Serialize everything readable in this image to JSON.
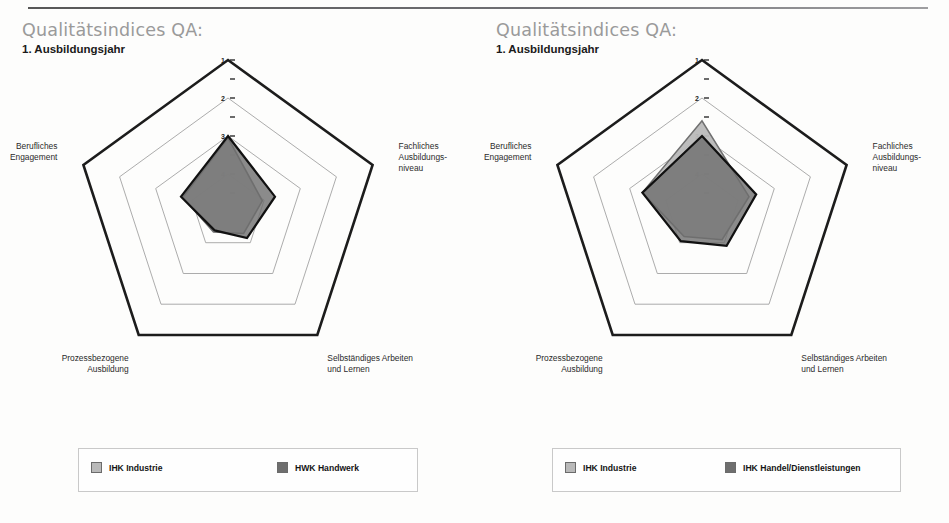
{
  "document": {
    "top_rule": true
  },
  "panels": [
    {
      "id": "left",
      "title": "Qualitätsindices QA:",
      "subtitle": "1. Ausbildungsjahr",
      "legend": [
        {
          "label": "IHK Industrie",
          "color": "#b9b9b9",
          "swatch": "light-gray-swatch"
        },
        {
          "label": "HWK Handwerk",
          "color": "#6e6e6e",
          "swatch": "dark-gray-swatch"
        }
      ]
    },
    {
      "id": "right",
      "title": "Qualitätsindices QA:",
      "subtitle": "1. Ausbildungsjahr",
      "legend": [
        {
          "label": "IHK Industrie",
          "color": "#b9b9b9",
          "swatch": "light-gray-swatch"
        },
        {
          "label": "IHK Handel/Dienstleistungen",
          "color": "#6e6e6e",
          "swatch": "dark-gray-swatch"
        }
      ]
    }
  ],
  "chart_data": [
    {
      "type": "radar",
      "title": "Qualitätsindices QA: 1. Ausbildungsjahr",
      "subtitle": "IHK Industrie vs. HWK Handwerk",
      "categories": [
        "Erfahrungsbasiertes Lernen",
        "Fachliches Ausbildungs-niveau",
        "Selbständiges Arbeiten und Lernen",
        "Prozessbezogene Ausbildung",
        "Berufliches Engagement"
      ],
      "category_lines": [
        [
          "Erfahrungsbasiertes",
          "Lernen"
        ],
        [
          "Fachliches",
          "Ausbildungs-",
          "niveau"
        ],
        [
          "Selbständiges Arbeiten",
          "und Lernen"
        ],
        [
          "Prozessbezogene",
          "Ausbildung"
        ],
        [
          "Berufliches",
          "Engagement"
        ]
      ],
      "rlim": [
        1,
        5
      ],
      "inverted_scale": true,
      "tick_labels": [
        "1",
        "2",
        "3",
        "4"
      ],
      "tick_values": [
        1,
        2,
        3,
        4
      ],
      "minor_tick_values": [
        1.5,
        2.5,
        3.5,
        4.5
      ],
      "grid": true,
      "legend_position": "bottom",
      "series": [
        {
          "name": "IHK Industrie",
          "color": "#b9b9b9",
          "values": [
            3.05,
            4.05,
            4.3,
            4.35,
            3.75
          ]
        },
        {
          "name": "HWK Handwerk",
          "color": "#6e6e6e",
          "values": [
            3.0,
            3.7,
            4.15,
            4.4,
            3.7
          ]
        }
      ]
    },
    {
      "type": "radar",
      "title": "Qualitätsindices QA: 1. Ausbildungsjahr",
      "subtitle": "IHK Industrie vs. IHK Handel/Dienstleistungen",
      "categories": [
        "Erfahrungsbasiertes Lernen",
        "Fachliches Ausbildungs-niveau",
        "Selbständiges Arbeiten und Lernen",
        "Prozessbezogene Ausbildung",
        "Berufliches Engagement"
      ],
      "category_lines": [
        [
          "Erfahrungsbasiertes",
          "Lernen"
        ],
        [
          "Fachliches",
          "Ausbildungs-",
          "niveau"
        ],
        [
          "Selbständiges Arbeiten",
          "und Lernen"
        ],
        [
          "Prozessbezogene",
          "Ausbildung"
        ],
        [
          "Berufliches",
          "Engagement"
        ]
      ],
      "rlim": [
        1,
        5
      ],
      "inverted_scale": true,
      "tick_labels": [
        "1",
        "2",
        "3",
        "4"
      ],
      "tick_values": [
        1,
        2,
        3,
        4
      ],
      "minor_tick_values": [
        1.5,
        2.5,
        3.5,
        4.5
      ],
      "grid": true,
      "legend_position": "bottom",
      "series": [
        {
          "name": "IHK Industrie",
          "color": "#b9b9b9",
          "values": [
            2.6,
            3.7,
            4.1,
            4.2,
            3.35
          ]
        },
        {
          "name": "IHK Handel/Dienstleistungen",
          "color": "#6e6e6e",
          "values": [
            3.0,
            3.5,
            3.9,
            4.05,
            3.35
          ]
        }
      ]
    }
  ]
}
